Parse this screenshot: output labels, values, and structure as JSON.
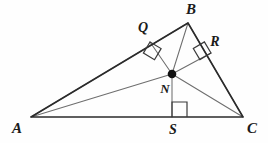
{
  "figure": {
    "kind": "geometry-diagram",
    "background_color": "#fefefe",
    "side_color": "#2b2b2b",
    "cevian_color": "#6e6e6e",
    "label_color": "#1a1a1a",
    "dot_color": "#111111",
    "vertices": [
      {
        "id": "A",
        "label": "A",
        "x": 31,
        "y": 117,
        "label_x": 17,
        "label_y": 133
      },
      {
        "id": "B",
        "label": "B",
        "x": 188,
        "y": 23,
        "label_x": 191,
        "label_y": 14
      },
      {
        "id": "C",
        "label": "C",
        "x": 243,
        "y": 117,
        "label_x": 252,
        "label_y": 133
      }
    ],
    "interior_point": {
      "id": "N",
      "label": "N",
      "x": 172,
      "y": 74,
      "radius": 4.3,
      "label_x": 165,
      "label_y": 93
    },
    "feet": [
      {
        "id": "Q",
        "label": "Q",
        "on_side": "AB",
        "x": 150,
        "y": 42,
        "label_x": 143,
        "label_y": 32
      },
      {
        "id": "R",
        "label": "R",
        "on_side": "BC",
        "x": 211,
        "y": 53,
        "label_x": 215,
        "label_y": 46
      },
      {
        "id": "S",
        "label": "S",
        "on_side": "AC",
        "x": 172,
        "y": 117,
        "label_x": 173,
        "label_y": 134
      }
    ],
    "sides": [
      {
        "id": "AB",
        "from": "A",
        "to": "B"
      },
      {
        "id": "BC",
        "from": "B",
        "to": "C"
      },
      {
        "id": "CA",
        "from": "C",
        "to": "A"
      }
    ],
    "cevians": [
      {
        "id": "AN-ext-B",
        "from": "A",
        "to": "B",
        "via": "N"
      },
      {
        "id": "CN-ext-B",
        "from": "C",
        "to": "B",
        "via": "N"
      },
      {
        "id": "AN",
        "from": "A",
        "to": "N"
      },
      {
        "id": "CN",
        "from": "C",
        "to": "N"
      },
      {
        "id": "BN",
        "from": "B",
        "to": "N"
      }
    ],
    "inradii": [
      {
        "id": "NQ",
        "from": "N",
        "to": "Q"
      },
      {
        "id": "NR",
        "from": "N",
        "to": "R"
      },
      {
        "id": "NS",
        "from": "N",
        "to": "S"
      }
    ],
    "right_angle_markers": [
      {
        "id": "marker-Q",
        "at": "Q",
        "size": 13
      },
      {
        "id": "marker-R",
        "at": "R",
        "size": 13
      },
      {
        "id": "marker-S",
        "at": "S",
        "size": 15
      }
    ]
  }
}
